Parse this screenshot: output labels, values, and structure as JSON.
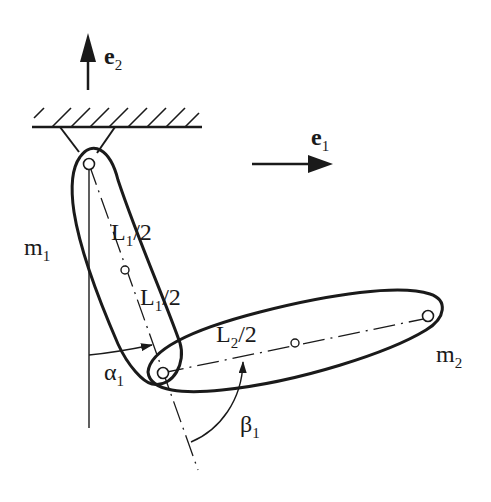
{
  "diagram": {
    "type": "double-pendulum-mechanism",
    "colors": {
      "stroke": "#1a1a1a",
      "background": "#ffffff"
    },
    "vectors": {
      "e2": {
        "base": "e",
        "sub": "2",
        "direction": "up"
      },
      "e1": {
        "base": "e",
        "sub": "1",
        "direction": "right"
      }
    },
    "bodies": {
      "link1": {
        "mass_base": "m",
        "mass_sub": "1"
      },
      "link2": {
        "mass_base": "m",
        "mass_sub": "2"
      }
    },
    "lengths": {
      "l1_upper": {
        "base": "L",
        "sub": "1",
        "suffix": "/2"
      },
      "l1_lower": {
        "base": "L",
        "sub": "1",
        "suffix": "/2"
      },
      "l2_half": {
        "base": "L",
        "sub": "2",
        "suffix": "/2"
      }
    },
    "angles": {
      "alpha": {
        "base": "α",
        "sub": "1"
      },
      "beta": {
        "base": "β",
        "sub": "1"
      }
    }
  }
}
